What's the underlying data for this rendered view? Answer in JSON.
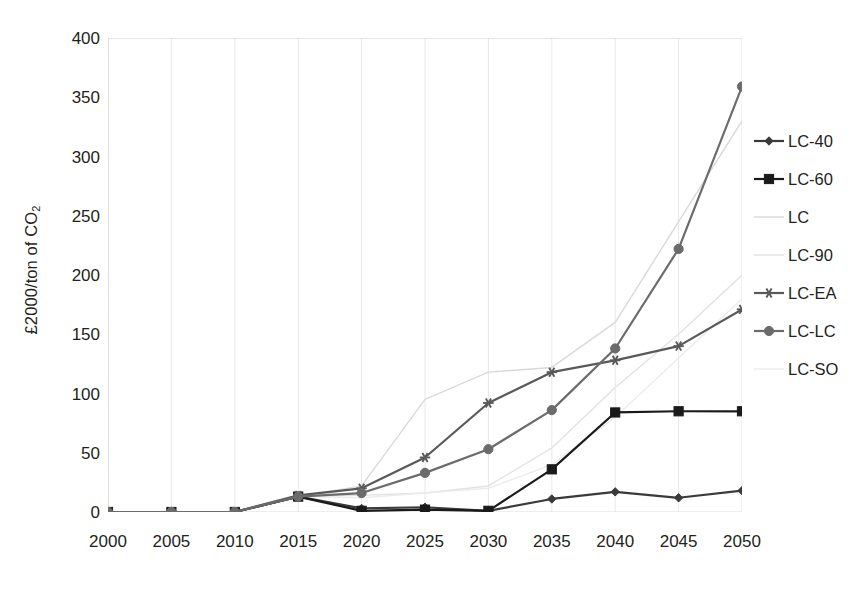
{
  "chart_data": {
    "type": "line",
    "title": "",
    "xlabel": "",
    "ylabel": "£2000/ton of CO₂",
    "x": [
      2000,
      2005,
      2010,
      2015,
      2020,
      2025,
      2030,
      2035,
      2040,
      2045,
      2050
    ],
    "xtick_labels": [
      "2000",
      "2005",
      "2010",
      "2015",
      "2020",
      "2025",
      "2030",
      "2035",
      "2040",
      "2045",
      "2050"
    ],
    "ytick_labels": [
      "400",
      "350",
      "300",
      "250",
      "200",
      "150",
      "100",
      "50",
      "0"
    ],
    "ylim": [
      0,
      400
    ],
    "xlim": [
      2000,
      2050
    ],
    "ytick_step": 50,
    "grid": "vertical-faint",
    "legend_position": "right",
    "series": [
      {
        "name": "LC-40",
        "marker": "diamond",
        "color": "#3a3a3a",
        "line_style": "solid",
        "values": [
          0,
          0,
          0,
          13,
          3,
          4,
          1,
          11,
          17,
          12,
          18
        ]
      },
      {
        "name": "LC-60",
        "marker": "square",
        "color": "#1a1a1a",
        "line_style": "solid",
        "values": [
          0,
          0,
          0,
          13,
          1,
          2,
          1,
          36,
          84,
          85,
          85
        ]
      },
      {
        "name": "LC",
        "marker": "none",
        "color": "#d9d9d9",
        "line_style": "solid",
        "values": [
          0,
          0,
          0,
          13,
          22,
          95,
          118,
          122,
          160,
          245,
          330
        ]
      },
      {
        "name": "LC-90",
        "marker": "none",
        "color": "#e2e2e2",
        "line_style": "solid",
        "values": [
          0,
          0,
          0,
          13,
          14,
          16,
          22,
          54,
          105,
          150,
          200
        ]
      },
      {
        "name": "LC-EA",
        "marker": "asterisk",
        "color": "#595959",
        "line_style": "solid",
        "values": [
          0,
          0,
          0,
          14,
          20,
          46,
          92,
          118,
          128,
          140,
          171
        ]
      },
      {
        "name": "LC-LC",
        "marker": "circle",
        "color": "#6b6b6b",
        "line_style": "solid",
        "values": [
          0,
          0,
          0,
          13,
          16,
          33,
          53,
          86,
          138,
          222,
          359
        ]
      },
      {
        "name": "LC-SO",
        "marker": "none",
        "color": "#ececec",
        "line_style": "solid",
        "values": [
          0,
          0,
          0,
          13,
          12,
          16,
          20,
          40,
          80,
          130,
          180
        ]
      }
    ]
  },
  "legend": {
    "items": [
      {
        "label": "LC-40"
      },
      {
        "label": "LC-60"
      },
      {
        "label": "LC"
      },
      {
        "label": "LC-90"
      },
      {
        "label": "LC-EA"
      },
      {
        "label": "LC-LC"
      },
      {
        "label": "LC-SO"
      }
    ]
  },
  "colors": {
    "axis": "#d0d0d0",
    "grid": "#e8e8e8",
    "text": "#231f20",
    "background": "#ffffff"
  }
}
